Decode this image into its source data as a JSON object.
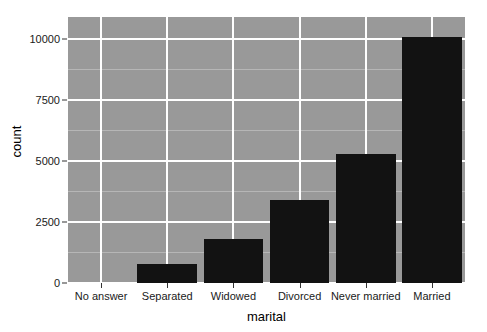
{
  "chart_data": {
    "type": "bar",
    "title": "",
    "subtitle": "",
    "xlabel": "marital",
    "ylabel": "count",
    "categories": [
      "No answer",
      "Separated",
      "Widowed",
      "Divorced",
      "Never married",
      "Married"
    ],
    "values": [
      0,
      780,
      1800,
      3400,
      5300,
      10100
    ],
    "series": [
      {
        "name": "count",
        "values": [
          0,
          780,
          1800,
          3400,
          5300,
          10100
        ]
      }
    ],
    "ylim": [
      0,
      10900
    ],
    "xlim": [
      0,
      6
    ],
    "y_ticks": [
      0,
      2500,
      5000,
      7500,
      10000
    ],
    "y_tick_labels": [
      "0",
      "2500",
      "5000",
      "7500",
      "10000"
    ],
    "y_minor_ticks": [
      1250,
      3750,
      6250,
      8750
    ],
    "grid": true,
    "grid_major_color": "#ffffff",
    "grid_minor_color": "#b6b6b6",
    "panel_background": "#999999",
    "bar_color": "#121212",
    "legend": null,
    "legend_position": "none",
    "annotations": []
  }
}
